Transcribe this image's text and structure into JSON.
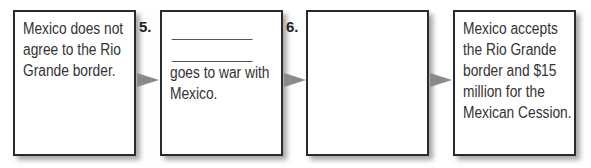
{
  "flowchart": {
    "boxes": [
      {
        "number": "",
        "text": "Mexico does not agree to the Rio Grande border.",
        "blank_lines": 0
      },
      {
        "number": "5.",
        "text": "goes to war with Mexico.",
        "blank_lines": 2
      },
      {
        "number": "6.",
        "text": "",
        "blank_lines": 0
      },
      {
        "number": "",
        "text": "Mexico accepts the Rio Grande border and $15 million for the Mexican Cession.",
        "blank_lines": 0
      }
    ],
    "arrows": [
      "box1-to-box2",
      "box2-to-box3",
      "box3-to-box4"
    ],
    "colors": {
      "border": "#2b2b2b",
      "arrow": "#8a8a8a",
      "text": "#333333"
    }
  }
}
